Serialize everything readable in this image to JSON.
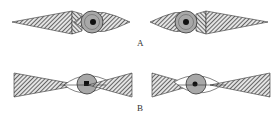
{
  "figure": {
    "panels": [
      {
        "label": "A",
        "description": "Eye with elongated diamond-shaped hatched visual fields, eye offset toward center",
        "figures": [
          {
            "side": "left",
            "eye_position": "right"
          },
          {
            "side": "right",
            "eye_position": "left"
          }
        ]
      },
      {
        "label": "B",
        "description": "Eye with bow-tie shaped hatched visual fields radiating from pupil",
        "figures": [
          {
            "side": "left",
            "eye_position": "right"
          },
          {
            "side": "right",
            "eye_position": "left"
          }
        ]
      }
    ]
  },
  "colors": {
    "hatch": "#555555",
    "iris": "#a8a8a8",
    "pupil": "#111111",
    "outline": "#333333",
    "background": "#ffffff"
  }
}
